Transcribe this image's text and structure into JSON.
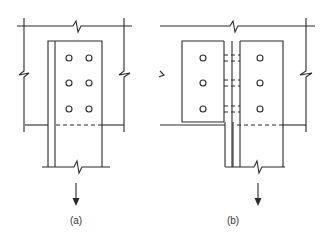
{
  "figure": {
    "panels": [
      {
        "id": "a",
        "label": "(a)",
        "description": "Single plate tension connection bolted to member, 2 columns x 3 rows of bolts",
        "bolt_columns": 2,
        "bolt_rows": 3,
        "load_direction": "down"
      },
      {
        "id": "b",
        "label": "(b)",
        "description": "Double plate (split) tension connection with stem, 1 column x 3 rows of bolts each side, hidden bolt lines through web",
        "bolt_columns": 2,
        "bolt_rows": 3,
        "load_direction": "down"
      }
    ],
    "colors": {
      "line": "#2a2a2a",
      "background": "#ffffff"
    }
  }
}
